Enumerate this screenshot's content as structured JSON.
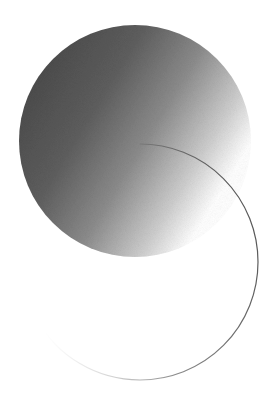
{
  "canvas": {
    "width": 273,
    "height": 413,
    "background": "#ffffff"
  },
  "shapes": {
    "filled_circle": {
      "cx": 135,
      "cy": 141,
      "r": 116,
      "gradient_dark": "#4a4a4a",
      "gradient_mid": "#8c8c8c",
      "gradient_light": "#ffffff"
    },
    "outline_circle": {
      "cx": 140,
      "cy": 262,
      "r": 118,
      "stroke_dark": "#555555",
      "stroke_light": "#f2f2f2",
      "stroke_width": 1.2
    }
  }
}
